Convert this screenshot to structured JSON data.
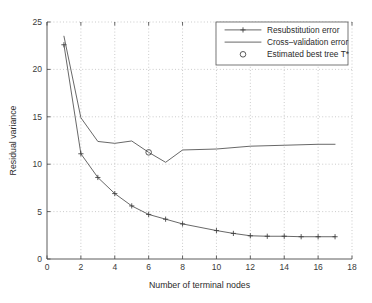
{
  "chart_data": {
    "type": "line",
    "title": "",
    "xlabel": "Number of terminal nodes",
    "ylabel": "Residual variance",
    "xlim": [
      0,
      18
    ],
    "ylim": [
      0,
      25
    ],
    "xticks": [
      0,
      2,
      4,
      6,
      8,
      10,
      12,
      14,
      16,
      18
    ],
    "yticks": [
      0,
      5,
      10,
      15,
      20,
      25
    ],
    "xtick_labels": [
      "0",
      "2",
      "4",
      "6",
      "8",
      "10",
      "12",
      "14",
      "16",
      "18"
    ],
    "ytick_labels": [
      "0",
      "5",
      "10",
      "15",
      "20",
      "25"
    ],
    "grid": true,
    "legend_position": "upper right",
    "series": [
      {
        "name": "Resubstitution error",
        "marker": "plus",
        "x": [
          1,
          2,
          3,
          4,
          5,
          6,
          7,
          8,
          10,
          11,
          12,
          13,
          14,
          15,
          16,
          17
        ],
        "values": [
          22.6,
          11.1,
          8.6,
          6.9,
          5.6,
          4.7,
          4.2,
          3.7,
          3.0,
          2.7,
          2.45,
          2.4,
          2.4,
          2.35,
          2.35,
          2.35
        ]
      },
      {
        "name": "Cross-validation error",
        "marker": "none",
        "x": [
          1,
          2,
          3,
          4,
          5,
          6,
          7,
          8,
          10,
          12,
          14,
          16,
          17
        ],
        "values": [
          23.5,
          14.9,
          12.4,
          12.2,
          12.45,
          11.25,
          10.2,
          11.5,
          11.6,
          11.9,
          12.0,
          12.1,
          12.1
        ]
      }
    ],
    "annotations": [
      {
        "name": "Estimated best tree T*",
        "marker": "circle",
        "x": 6,
        "y": 11.25
      }
    ],
    "legend": [
      {
        "label": "Resubstitution error",
        "marker": "line-plus"
      },
      {
        "label": "Cross–validation error",
        "marker": "line"
      },
      {
        "label": "Estimated best tree T*",
        "marker": "circle"
      }
    ]
  },
  "colors": {
    "line": "#4d4d4d",
    "axis": "#4a4a4a",
    "grid": "#a8a8a8",
    "text": "#2b2b2b",
    "background": "#ffffff"
  }
}
